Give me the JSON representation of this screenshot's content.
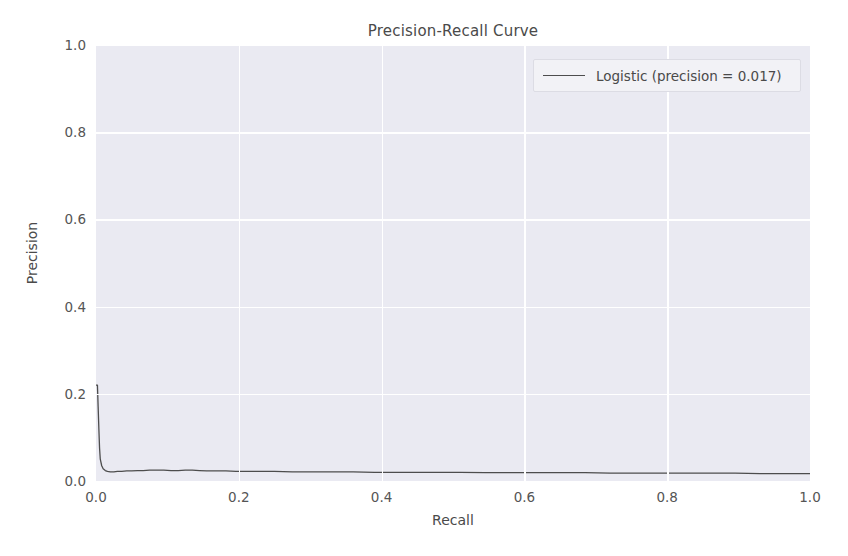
{
  "chart_data": {
    "type": "line",
    "title": "Precision-Recall Curve",
    "xlabel": "Recall",
    "ylabel": "Precision",
    "xlim": [
      0.0,
      1.0
    ],
    "ylim": [
      0.0,
      1.0
    ],
    "xticks": [
      "0.0",
      "0.2",
      "0.4",
      "0.6",
      "0.8",
      "1.0"
    ],
    "xtick_values": [
      0.0,
      0.2,
      0.4,
      0.6,
      0.8,
      1.0
    ],
    "yticks": [
      "0.0",
      "0.2",
      "0.4",
      "0.6",
      "0.8",
      "1.0"
    ],
    "ytick_values": [
      0.0,
      0.2,
      0.4,
      0.6,
      0.8,
      1.0
    ],
    "grid": true,
    "legend_position": "upper right",
    "legend": [
      "Logistic (precision = 0.017)"
    ],
    "series": [
      {
        "name": "Logistic (precision = 0.017)",
        "color": "#4d4d4d",
        "linewidth": 1.3,
        "x": [
          0.0,
          0.002,
          0.003,
          0.004,
          0.005,
          0.006,
          0.008,
          0.01,
          0.013,
          0.016,
          0.02,
          0.025,
          0.03,
          0.036,
          0.043,
          0.05,
          0.058,
          0.066,
          0.075,
          0.085,
          0.095,
          0.105,
          0.115,
          0.125,
          0.135,
          0.145,
          0.155,
          0.168,
          0.182,
          0.196,
          0.21,
          0.23,
          0.25,
          0.275,
          0.3,
          0.33,
          0.36,
          0.39,
          0.42,
          0.45,
          0.48,
          0.51,
          0.545,
          0.58,
          0.615,
          0.65,
          0.685,
          0.72,
          0.755,
          0.79,
          0.825,
          0.86,
          0.895,
          0.93,
          0.965,
          1.0
        ],
        "y": [
          0.22,
          0.22,
          0.17,
          0.12,
          0.075,
          0.05,
          0.035,
          0.028,
          0.024,
          0.022,
          0.021,
          0.021,
          0.022,
          0.022,
          0.023,
          0.023,
          0.024,
          0.024,
          0.025,
          0.025,
          0.025,
          0.024,
          0.024,
          0.025,
          0.025,
          0.024,
          0.023,
          0.023,
          0.023,
          0.022,
          0.022,
          0.022,
          0.022,
          0.021,
          0.021,
          0.021,
          0.021,
          0.02,
          0.02,
          0.02,
          0.02,
          0.02,
          0.019,
          0.019,
          0.019,
          0.019,
          0.019,
          0.018,
          0.018,
          0.018,
          0.018,
          0.018,
          0.018,
          0.017,
          0.017,
          0.017
        ]
      }
    ],
    "annotations": {
      "precision_value": "0.017",
      "model_name": "Logistic"
    },
    "style": {
      "axes_facecolor": "#eaeaf2",
      "figure_facecolor": "#ffffff",
      "grid_color": "#ffffff",
      "text_color": "#4a4a4a",
      "tick_color": "#555555"
    }
  }
}
